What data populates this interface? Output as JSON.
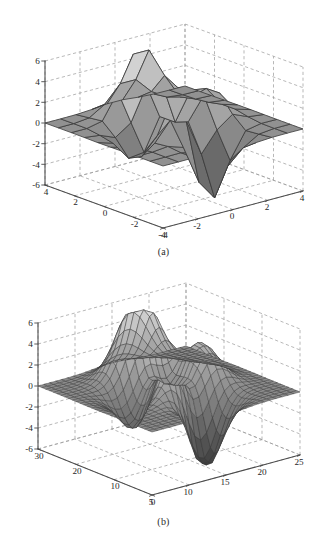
{
  "figure": {
    "background": "#ffffff",
    "ink": "#1f1f1f",
    "grid_color": "#9a9a9a",
    "axis_color": "#4a4a4a",
    "mesh_color": "#3a3a3a"
  },
  "panels": [
    {
      "id": "a",
      "caption": "(a)",
      "chart_data": {
        "type": "surface",
        "title": "",
        "function": "peaks",
        "mesh": "coarse",
        "shading": "flat",
        "colormap": "gray",
        "nx": 9,
        "ny": 9,
        "xlabel": "",
        "ylabel": "",
        "zlabel": "",
        "xlim": [
          -4,
          4
        ],
        "ylim": [
          -4,
          4
        ],
        "zlim": [
          -6,
          6
        ],
        "xticks": [
          -4,
          -2,
          0,
          2,
          4
        ],
        "xticklabels": [
          "-4",
          "-2",
          "0",
          "2",
          "4"
        ],
        "yticks": [
          -4,
          -2,
          0,
          2,
          4
        ],
        "yticklabels": [
          "4",
          "2",
          "0",
          "-2",
          "-4"
        ],
        "zticks": [
          -6,
          -4,
          -2,
          0,
          2,
          4,
          6
        ],
        "zticklabels": [
          "-6",
          "-4",
          "-2",
          "0",
          "2",
          "4",
          "6"
        ],
        "grid": true,
        "legend": "none",
        "view_azimuth": -37.5,
        "view_elevation": 30
      }
    },
    {
      "id": "b",
      "caption": "(b)",
      "chart_data": {
        "type": "surface",
        "title": "",
        "function": "peaks",
        "mesh": "fine",
        "shading": "faceted",
        "colormap": "gray",
        "nx": 25,
        "ny": 30,
        "xlabel": "",
        "ylabel": "",
        "zlabel": "",
        "xlim": [
          0,
          25
        ],
        "ylim": [
          0,
          30
        ],
        "zlim": [
          -6,
          6
        ],
        "xticks": [
          5,
          10,
          15,
          20,
          25
        ],
        "xticklabels": [
          "5",
          "10",
          "15",
          "20",
          "25"
        ],
        "yticks": [
          0,
          10,
          20,
          30
        ],
        "yticklabels": [
          "30",
          "20",
          "10",
          "0"
        ],
        "zticks": [
          -6,
          -4,
          -2,
          0,
          2,
          4,
          6
        ],
        "zticklabels": [
          "-6",
          "-4",
          "-2",
          "0",
          "2",
          "4",
          "6"
        ],
        "grid": true,
        "legend": "none",
        "view_azimuth": -37.5,
        "view_elevation": 30
      }
    }
  ]
}
